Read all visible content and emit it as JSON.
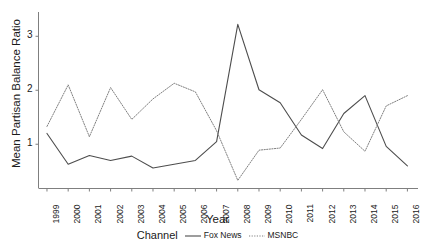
{
  "chart_data": {
    "type": "line",
    "title": "",
    "xlabel": "Year",
    "ylabel": "Mean Partisan Balance Ratio",
    "x": [
      1999,
      2000,
      2001,
      2002,
      2003,
      2004,
      2005,
      2006,
      2007,
      2008,
      2009,
      2010,
      2011,
      2012,
      2013,
      2014,
      2015,
      2016
    ],
    "xtick_labels": [
      "1999",
      "2000",
      "2001",
      "2002",
      "2003",
      "2004",
      "2005",
      "2006",
      "2007",
      "2008",
      "2009",
      "2010",
      "2011",
      "2012",
      "2013",
      "2014",
      "2015",
      "2016"
    ],
    "ytick_labels": [
      "1",
      "2",
      "3"
    ],
    "yticks": [
      1,
      2,
      3
    ],
    "ylim": [
      0.18,
      3.45
    ],
    "xlim": [
      1998.6,
      2016.5
    ],
    "grid": false,
    "legend_position": "bottom",
    "legend_title": "Channel",
    "series": [
      {
        "name": "Fox News",
        "style": "solid",
        "color": "#4d4d4d",
        "values": [
          1.2,
          0.63,
          0.79,
          0.7,
          0.78,
          0.56,
          0.63,
          0.7,
          1.05,
          3.22,
          2.01,
          1.77,
          1.17,
          0.92,
          1.57,
          1.9,
          0.96,
          0.6
        ]
      },
      {
        "name": "MSNBC",
        "style": "dotted",
        "color": "#808080",
        "values": [
          1.33,
          2.1,
          1.14,
          2.05,
          1.46,
          1.84,
          2.13,
          1.97,
          1.25,
          0.33,
          0.89,
          0.93,
          1.46,
          2.01,
          1.23,
          0.87,
          1.71,
          1.9
        ]
      }
    ]
  },
  "legend": {
    "title": "Channel",
    "entries": [
      {
        "label": "Fox News",
        "style": "solid"
      },
      {
        "label": "MSNBC",
        "style": "dotted"
      }
    ]
  },
  "axes": {
    "x_title": "Year",
    "y_title": "Mean Partisan Balance Ratio"
  },
  "colors": {
    "fox_news": "#4d4d4d",
    "msnbc": "#808080",
    "axis": "#7f7f7f",
    "text": "#1a1a1a",
    "background": "#ffffff"
  }
}
